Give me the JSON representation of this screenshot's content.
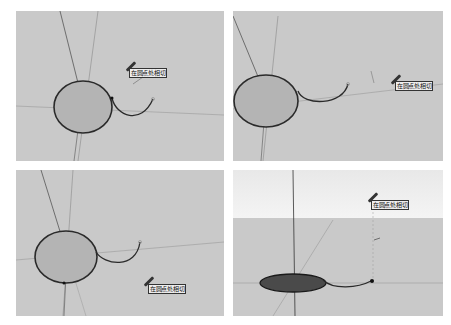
{
  "panels": [
    {
      "id": "step-1",
      "tooltip": "在圆点处相切",
      "view": "perspective",
      "face_color": "#b4b4b4",
      "edge_color": "#2a2a2a"
    },
    {
      "id": "step-2",
      "tooltip": "在圆点处相切",
      "view": "perspective",
      "face_color": "#b4b4b4",
      "edge_color": "#2a2a2a"
    },
    {
      "id": "step-3",
      "tooltip": "在圆点处相切",
      "view": "perspective",
      "face_color": "#b4b4b4",
      "edge_color": "#2a2a2a"
    },
    {
      "id": "step-4",
      "tooltip": "在圆点处相切",
      "view": "perspective-with-sky",
      "face_color": "#4a4a4a",
      "edge_color": "#1a1a1a"
    }
  ],
  "colors": {
    "viewport_bg": "#c9c9c9",
    "sky": "#f0f0f0",
    "axis_red": "#8a5a5a",
    "axis_green": "#6a7a6a",
    "axis_blue": "#3a3a5a"
  }
}
